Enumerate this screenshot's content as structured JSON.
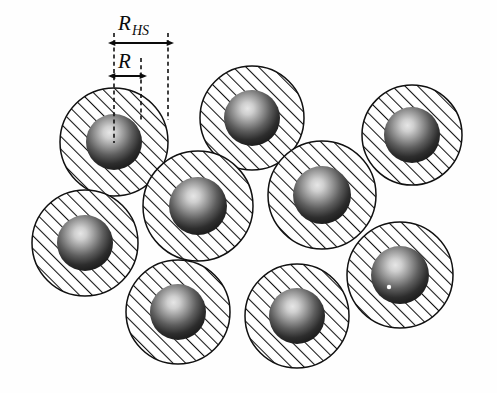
{
  "figure": {
    "background_color": "#fefefe",
    "ink_color": "#101010",
    "hatch_color": "#111111",
    "sphere_dark": "#121212",
    "sphere_highlight": "#e2e2e2"
  },
  "annotations": {
    "hs_label": {
      "base": "R",
      "subscript": "HS",
      "name": "hard-sphere-radius-label"
    },
    "core_label": {
      "base": "R",
      "subscript": "",
      "name": "core-radius-label"
    }
  },
  "dimension_lines": [
    {
      "id": "R_HS",
      "label": "R_HS",
      "x_start": 114,
      "x_end": 168,
      "y": 43,
      "length_px": 54
    },
    {
      "id": "R",
      "label": "R",
      "x_start": 114,
      "x_end": 141,
      "y": 76,
      "length_px": 27
    }
  ],
  "guide_lines": [
    {
      "id": "center-guide",
      "x": 114,
      "y_top": 33,
      "y_bottom": 143
    },
    {
      "id": "core-edge-guide",
      "x": 141,
      "y_top": 58,
      "y_bottom": 120
    },
    {
      "id": "hs-edge-guide",
      "x": 168,
      "y_top": 33,
      "y_bottom": 120
    }
  ],
  "particles": [
    {
      "id": 1,
      "cx": 114,
      "cy": 142,
      "r_hs": 54,
      "r_core": 28,
      "speck": false
    },
    {
      "id": 2,
      "cx": 252,
      "cy": 118,
      "r_hs": 52,
      "r_core": 28,
      "speck": false
    },
    {
      "id": 3,
      "cx": 412,
      "cy": 135,
      "r_hs": 50,
      "r_core": 28,
      "speck": false
    },
    {
      "id": 4,
      "cx": 85,
      "cy": 243,
      "r_hs": 53,
      "r_core": 28,
      "speck": false
    },
    {
      "id": 5,
      "cx": 198,
      "cy": 206,
      "r_hs": 55,
      "r_core": 29,
      "speck": false
    },
    {
      "id": 6,
      "cx": 322,
      "cy": 195,
      "r_hs": 54,
      "r_core": 29,
      "speck": false
    },
    {
      "id": 7,
      "cx": 178,
      "cy": 312,
      "r_hs": 52,
      "r_core": 28,
      "speck": false
    },
    {
      "id": 8,
      "cx": 297,
      "cy": 316,
      "r_hs": 52,
      "r_core": 28,
      "speck": false
    },
    {
      "id": 9,
      "cx": 400,
      "cy": 275,
      "r_hs": 53,
      "r_core": 29,
      "speck": true
    },
    {
      "id": 10,
      "cx": 268,
      "cy": 232,
      "r_hs": 0,
      "r_core": 0,
      "speck": false
    }
  ],
  "particle_count": 9,
  "hatch": {
    "angle_deg": 45,
    "spacing_px": 9,
    "line_width_px": 2
  }
}
